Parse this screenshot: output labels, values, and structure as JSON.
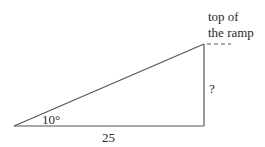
{
  "diagram": {
    "type": "right-triangle ramp",
    "angle_label": "10°",
    "base_label": "25",
    "height_label": "?",
    "top_label_line1": "top of",
    "top_label_line2": "the ramp",
    "colors": {
      "line": "#555555",
      "text": "#2a2a2a",
      "background": "#ffffff"
    }
  }
}
